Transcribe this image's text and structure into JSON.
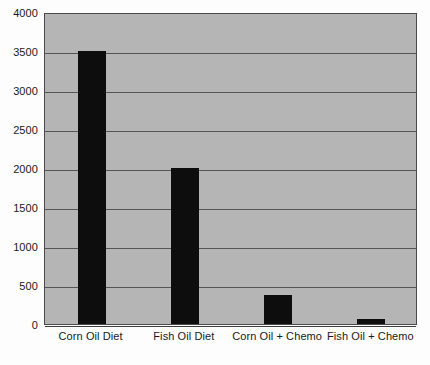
{
  "chart_data": {
    "type": "bar",
    "title": "",
    "xlabel": "",
    "ylabel": "",
    "categories": [
      "Corn Oil Diet",
      "Fish Oil Diet",
      "Corn Oil + Chemo",
      "Fish Oil + Chemo"
    ],
    "values": [
      3500,
      2000,
      370,
      60
    ],
    "ylim": [
      0,
      4000
    ],
    "ytick_labels": [
      "4000",
      "3500",
      "3000",
      "2500",
      "2000",
      "1500",
      "1000",
      "500",
      "0"
    ],
    "ytick_values": [
      4000,
      3500,
      3000,
      2500,
      2000,
      1500,
      1000,
      500,
      0
    ],
    "grid": true,
    "legend": "none",
    "colors": {
      "bar": "#0d0d0d",
      "plot_background": "#b5b5b5",
      "page_background": "#fdfdfd",
      "gridline": "#555555",
      "axis_border": "#4a4a4a",
      "text": "#1a1a1a"
    }
  }
}
